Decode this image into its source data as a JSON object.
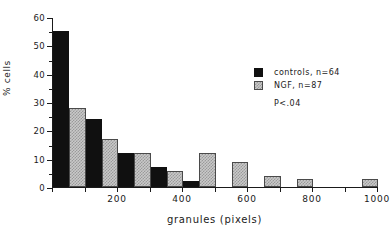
{
  "chart_data": {
    "type": "bar",
    "title": "",
    "xlabel": "granules (pixels)",
    "ylabel": "% cells",
    "ylim": [
      0,
      60
    ],
    "ytick_labels": [
      "0",
      "10",
      "20",
      "30",
      "40",
      "50",
      "60"
    ],
    "ytick_values": [
      0,
      10,
      20,
      30,
      40,
      50,
      60
    ],
    "yminor_step": 5,
    "xlim": [
      0,
      1000
    ],
    "xtick_labels": [
      "200",
      "400",
      "600",
      "800",
      "1000"
    ],
    "xtick_values": [
      200,
      400,
      600,
      800,
      1000
    ],
    "grid": false,
    "legend_position": "upper right",
    "bin_width": 100,
    "categories": [
      "0-100",
      "100-200",
      "200-300",
      "300-400",
      "400-500",
      "500-600",
      "600-700",
      "700-800",
      "800-900",
      "900-1000"
    ],
    "bin_centers": [
      50,
      150,
      250,
      350,
      450,
      550,
      650,
      750,
      850,
      950
    ],
    "series": [
      {
        "name": "controls",
        "n": 64,
        "color": "#101010",
        "values": [
          55,
          24,
          12,
          7,
          2,
          0,
          0,
          0,
          0,
          0
        ]
      },
      {
        "name": "NGF",
        "n": 87,
        "color": "#c9c9c9",
        "values": [
          28,
          17,
          12,
          5.5,
          12,
          9,
          4,
          3,
          0,
          3
        ]
      }
    ],
    "annotations": [
      "P<.04"
    ]
  },
  "legend": {
    "items": [
      {
        "label": "controls,  n=64",
        "swatch": "controls"
      },
      {
        "label": "NGF,  n=87",
        "swatch": "ngf"
      }
    ],
    "pvalue": "P<.04"
  },
  "axes": {
    "ylabel": "% cells",
    "xlabel": "granules (pixels)"
  }
}
